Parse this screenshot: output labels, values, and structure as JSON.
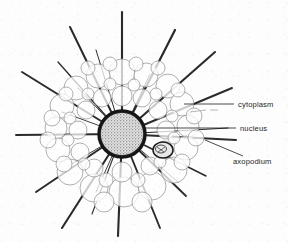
{
  "figure": {
    "kind": "biological-line-drawing",
    "background_color": "#fdfdfd",
    "ink_color": "#1d1d1d",
    "cytoplasm_outline_color": "#8a8a8a",
    "nucleus_ring_color": "#151515",
    "nucleus_fill_color": "#cfcfcf",
    "axopodium_color": "#2a2a2a"
  },
  "labels": [
    {
      "id": "cytoplasm",
      "text": "cytoplasm",
      "text_x": 238,
      "text_y": 107,
      "leader": {
        "x1": 184,
        "y1": 104,
        "x2": 234,
        "y2": 104
      }
    },
    {
      "id": "nucleus",
      "text": "nucleus",
      "text_x": 240,
      "text_y": 131,
      "leader": {
        "x1": 143,
        "y1": 128,
        "x2": 236,
        "y2": 128
      }
    },
    {
      "id": "axopodium",
      "text": "axopodium",
      "text_x": 233,
      "text_y": 164,
      "leader": {
        "x1": 205,
        "y1": 140,
        "x2": 243,
        "y2": 155
      }
    }
  ],
  "nucleus": {
    "center_x": 122,
    "center_y": 134,
    "radius": 23,
    "ring_width": 3.4
  },
  "cell_body": {
    "center_x": 122,
    "center_y": 134,
    "radius_x": 68,
    "radius_y": 64
  },
  "food_vacuole": {
    "center_x": 163,
    "center_y": 150,
    "radius_x": 10,
    "radius_y": 8
  },
  "axopodia_angles_deg": [
    -90,
    -72,
    -57,
    -40,
    -24,
    -8,
    6,
    20,
    34,
    50,
    66,
    82,
    96,
    112,
    128,
    144,
    160,
    176,
    192,
    208,
    224,
    240,
    256,
    270
  ],
  "axopodia_count": 24
}
